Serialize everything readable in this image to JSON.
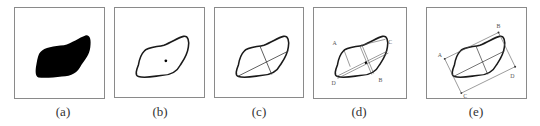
{
  "figure": {
    "panels": [
      {
        "id": "a",
        "caption": "(a)",
        "content": "filled-shape"
      },
      {
        "id": "b",
        "caption": "(b)",
        "content": "contour-with-centroid"
      },
      {
        "id": "c",
        "caption": "(c)",
        "content": "contour-with-principal-axes"
      },
      {
        "id": "d",
        "caption": "(d)",
        "content": "contour-with-axes-and-extreme-points",
        "points": [
          "A",
          "B",
          "C",
          "D"
        ]
      },
      {
        "id": "e",
        "caption": "(e)",
        "content": "contour-with-bounding-rectangle",
        "points": [
          "A",
          "B",
          "C",
          "D"
        ]
      }
    ]
  },
  "colors": {
    "shape_fill": "#000000",
    "outline": "#1a1a1a",
    "axis_line": "#333333",
    "frame": "#8a8a8a",
    "label": "#555555"
  }
}
